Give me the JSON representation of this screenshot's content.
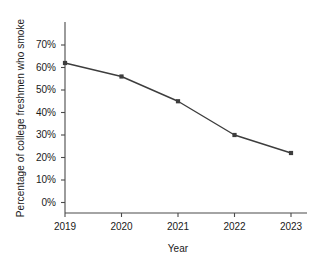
{
  "chart_data": {
    "type": "line",
    "title": "",
    "xlabel": "Year",
    "ylabel": "Percentage of college freshmen who smoke",
    "categories": [
      "2019",
      "2020",
      "2021",
      "2022",
      "2023"
    ],
    "values": [
      62,
      56,
      45,
      30,
      22
    ],
    "series": [
      {
        "name": "Percentage of college freshmen who smoke",
        "values": [
          62,
          56,
          45,
          30,
          22
        ]
      }
    ],
    "ytick_labels": [
      "0%",
      "10%",
      "20%",
      "30%",
      "40%",
      "50%",
      "60%",
      "70%"
    ],
    "ytick_values": [
      0,
      10,
      20,
      30,
      40,
      50,
      60,
      70
    ],
    "xtick_labels": [
      "2019",
      "2020",
      "2021",
      "2022",
      "2023"
    ],
    "ylim": [
      0,
      70
    ],
    "xlim": [
      "2019",
      "2023"
    ],
    "grid": false,
    "legend": false,
    "legend_position": "none",
    "line_color": "#3d3d3d",
    "marker_color": "#3d3d3d",
    "marker_shape": "square",
    "axis_color": "#4a4a4a",
    "background_color": "#ffffff"
  }
}
